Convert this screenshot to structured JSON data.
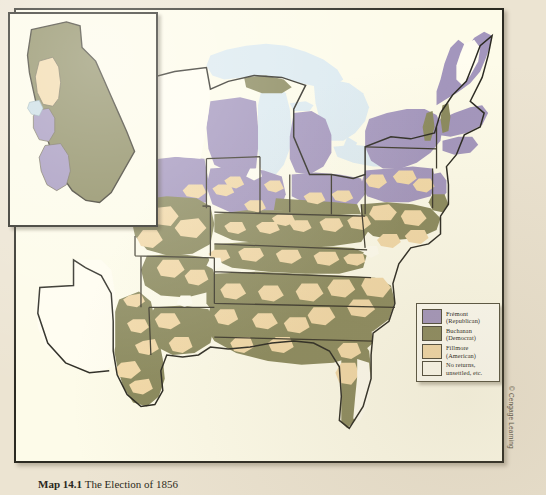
{
  "caption": {
    "label": "Map 14.1 ",
    "text": "The Election of 1856"
  },
  "credit": "© Cengage Learning",
  "colors": {
    "page_background": "#ece4d2",
    "map_background": "#fdfbe9",
    "fremont_purple": "#a396bd",
    "buchanan_olive": "#8b8a5e",
    "fillmore_tan": "#f2d9a8",
    "no_returns_white": "#fffdf0",
    "water_lake": "#dceaf0",
    "border_dark": "#2b2a22",
    "county_line": "#6f6a52"
  },
  "legend": {
    "items": [
      {
        "candidate": "Frémont",
        "party": "(Republican)",
        "color": "#a396bd"
      },
      {
        "candidate": "Buchanan",
        "party": "(Democrat)",
        "color": "#8b8a5e"
      },
      {
        "candidate": "Fillmore",
        "party": "(American)",
        "color": "#f2d9a8"
      },
      {
        "candidate": "No returns,",
        "party": "unsettled, etc.",
        "color": "#fffdf0"
      }
    ]
  },
  "inset": {
    "name": "California",
    "regions": [
      {
        "name": "california-buchanan-body",
        "result": "Buchanan"
      },
      {
        "name": "california-fillmore-north",
        "result": "Fillmore"
      },
      {
        "name": "california-fremont-central",
        "result": "Frémont"
      },
      {
        "name": "california-fremont-south",
        "result": "Frémont"
      }
    ]
  },
  "map": {
    "name": "election-of-1856-county-map",
    "water_bodies": [
      "Lake Superior",
      "Lake Michigan",
      "Lake Huron",
      "Lake Erie",
      "Lake Ontario",
      "Gulf of Mexico",
      "Atlantic Ocean"
    ],
    "regions": [
      {
        "name": "new-england-northeast",
        "result": "Frémont"
      },
      {
        "name": "new-york",
        "result": "Frémont"
      },
      {
        "name": "upper-midwest",
        "result": "Frémont"
      },
      {
        "name": "ohio-indiana-illinois",
        "result": "Mixed"
      },
      {
        "name": "border-states",
        "result": "Mixed"
      },
      {
        "name": "deep-south",
        "result": "Buchanan"
      },
      {
        "name": "texas-east",
        "result": "Buchanan"
      },
      {
        "name": "texas-west-unsettled",
        "result": "No returns"
      },
      {
        "name": "florida",
        "result": "Mixed"
      },
      {
        "name": "maine-interior-unsettled",
        "result": "No returns"
      },
      {
        "name": "minnesota-territory-unsettled",
        "result": "No returns"
      }
    ]
  }
}
